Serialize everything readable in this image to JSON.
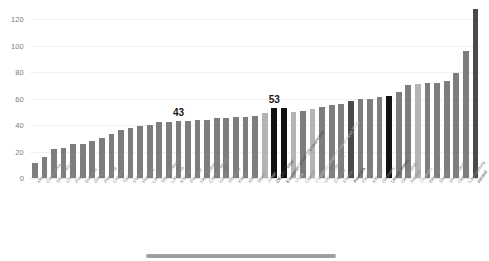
{
  "chart_data": {
    "type": "bar",
    "title": "",
    "subtitle": "",
    "xlabel": "",
    "ylabel": "",
    "ylim": [
      0,
      130
    ],
    "grid": true,
    "legend": "none",
    "ytick_labels": [
      "0",
      "20",
      "40",
      "60",
      "80",
      "100",
      "120"
    ],
    "ytick_values": [
      0,
      20,
      40,
      60,
      80,
      100,
      120
    ],
    "categories": [
      "Mexico",
      "Costa Rica",
      "South Africa",
      "Chile",
      "Russia",
      "Bulgaria",
      "Greece",
      "Romania",
      "Croatia",
      "Turkey",
      "Poland",
      "Hungary",
      "Latvia",
      "Slovak Republic",
      "Lithuania",
      "Estonia",
      "Portugal",
      "New Zealand",
      "Czech Republic",
      "Israel",
      "Slovenia",
      "Korea",
      "Italy",
      "Spain",
      "Japan",
      "OECD - Total",
      "European Union (28 countries)",
      "Malta",
      "Cyprus",
      "European Union (27 countries) 2020",
      "United Kingdom",
      "Canada",
      "France",
      "Australia",
      "Finland",
      "Iceland",
      "Germany",
      "United States",
      "Netherlands",
      "Austria",
      "Denmark",
      "Belgium",
      "Sweden",
      "Switzerland",
      "Norway",
      "Luxembourg",
      "Ireland"
    ],
    "values": [
      11,
      16,
      22,
      23,
      26,
      26,
      28,
      30,
      33,
      36,
      38,
      39,
      40,
      42,
      42,
      43,
      43,
      44,
      44,
      45,
      45,
      46,
      46,
      47,
      49,
      53,
      53,
      50,
      51,
      52,
      54,
      55,
      56,
      58,
      60,
      60,
      61,
      62,
      65,
      70,
      71,
      72,
      72,
      73,
      79,
      96,
      128
    ],
    "bar_styles": [
      "normal",
      "normal",
      "normal",
      "normal",
      "normal",
      "normal",
      "normal",
      "normal",
      "normal",
      "normal",
      "normal",
      "normal",
      "normal",
      "normal",
      "normal",
      "normal",
      "normal",
      "normal",
      "normal",
      "normal",
      "normal",
      "normal",
      "normal",
      "normal",
      "light",
      "black",
      "black",
      "light",
      "normal",
      "light",
      "normal",
      "normal",
      "normal",
      "dark",
      "normal",
      "normal",
      "normal",
      "black",
      "normal",
      "normal",
      "light",
      "normal",
      "normal",
      "normal",
      "normal",
      "normal",
      "dark"
    ],
    "annotations": [
      {
        "label": "43",
        "category": "Estonia",
        "index": 15,
        "value": 43
      },
      {
        "label": "53",
        "category": "OECD - Total",
        "index": 25,
        "value": 53
      }
    ],
    "highlight_colors": {
      "normal": "#7d7d7d",
      "dark": "#4a4a4a",
      "black": "#111111",
      "light": "#b4b4b4",
      "gridline": "#f0f0f0",
      "axis_text": "#7b7b7b",
      "category_text": "#8c8c8c"
    }
  }
}
